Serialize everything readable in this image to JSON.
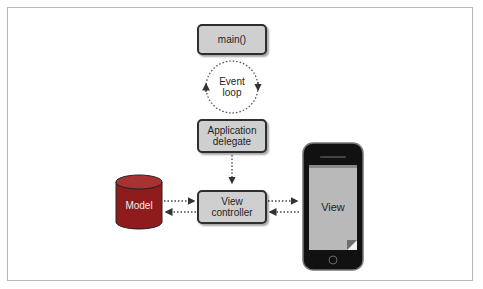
{
  "diagram": {
    "nodes": {
      "main": {
        "label": "main()"
      },
      "event_loop": {
        "label_line1": "Event",
        "label_line2": "loop"
      },
      "app_delegate": {
        "label_line1": "Application",
        "label_line2": "delegate"
      },
      "view_controller": {
        "label_line1": "View",
        "label_line2": "controller"
      },
      "model": {
        "label": "Model"
      },
      "view": {
        "label": "View"
      }
    },
    "edges": [
      {
        "from": "main",
        "to": "event_loop",
        "style": "none"
      },
      {
        "from": "event_loop",
        "to": "event_loop",
        "style": "dotted-cycle"
      },
      {
        "from": "app_delegate",
        "to": "view_controller",
        "style": "dotted-arrow"
      },
      {
        "from": "model",
        "to": "view_controller",
        "style": "dotted-arrow"
      },
      {
        "from": "view_controller",
        "to": "model",
        "style": "dotted-arrow"
      },
      {
        "from": "view_controller",
        "to": "view",
        "style": "dotted-arrow"
      },
      {
        "from": "view",
        "to": "view_controller",
        "style": "dotted-arrow"
      }
    ],
    "colors": {
      "box_fill": "#cfcfcf",
      "box_border": "#2e2e2e",
      "model_fill": "#8e1c1c",
      "view_screen": "#b9b9b9",
      "phone_body": "#111111"
    }
  }
}
